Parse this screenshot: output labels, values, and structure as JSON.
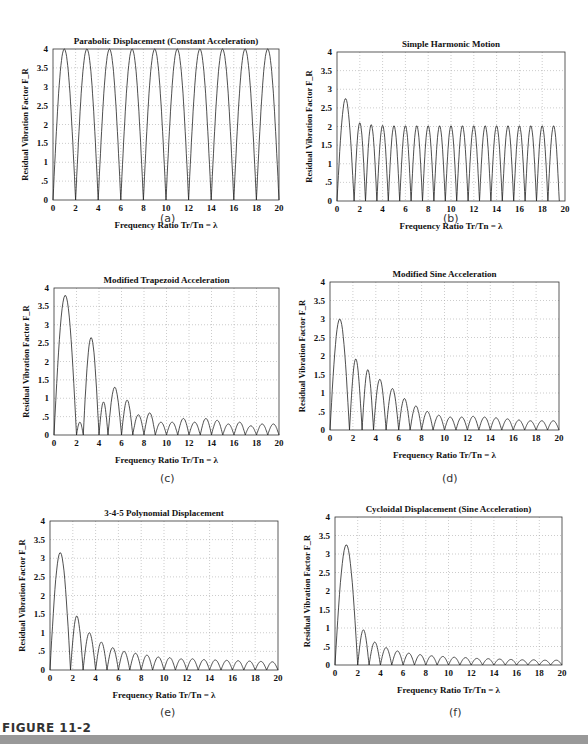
{
  "figure": {
    "label": "FIGURE 11-2"
  },
  "common": {
    "xlabel": "Frequency Ratio  Tr/Tn  = λ",
    "ylabel": "Residual Vibration Factor  F_R",
    "xticks": [
      0,
      2,
      4,
      6,
      8,
      10,
      12,
      14,
      16,
      18,
      20
    ],
    "yticks": [
      "0",
      ".5",
      "1",
      "1.5",
      "2",
      "2.5",
      "3",
      "3.5",
      "4"
    ]
  },
  "chart_data": [
    {
      "id": "a",
      "type": "line",
      "title": "Parabolic Displacement (Constant Acceleration)",
      "subcaption": "(a)",
      "xlabel": "Frequency Ratio Tr/Tn = λ",
      "ylabel": "Residual Vibration Factor F_R",
      "xlim": [
        0,
        20
      ],
      "ylim": [
        0,
        4
      ],
      "grid": true,
      "model": "abs_sin_peaks",
      "peaks": [
        {
          "x": 1,
          "y": 4
        },
        {
          "x": 3,
          "y": 4
        },
        {
          "x": 5,
          "y": 4
        },
        {
          "x": 7,
          "y": 4
        },
        {
          "x": 9,
          "y": 4
        },
        {
          "x": 11,
          "y": 4
        },
        {
          "x": 13,
          "y": 4
        },
        {
          "x": 15,
          "y": 4
        },
        {
          "x": 17,
          "y": 4
        },
        {
          "x": 19,
          "y": 4
        }
      ],
      "zeros": [
        0,
        2,
        4,
        6,
        8,
        10,
        12,
        14,
        16,
        18,
        20
      ]
    },
    {
      "id": "b",
      "type": "line",
      "title": "Simple Harmonic Motion",
      "subcaption": "(b)",
      "xlabel": "Frequency Ratio Tr/Tn = λ",
      "ylabel": "Residual Vibration Factor F_R",
      "xlim": [
        0,
        20
      ],
      "ylim": [
        0,
        4
      ],
      "grid": true,
      "zeros": [
        0,
        1.5,
        2.5,
        3.5,
        4.5,
        5.5,
        6.5,
        7.5,
        8.5,
        9.5,
        10.5,
        11.5,
        12.5,
        13.5,
        14.5,
        15.5,
        16.5,
        17.5,
        18.5,
        19.5
      ],
      "peak_values": [
        2.75,
        2.1,
        2.05,
        2.03,
        2.02,
        2.02,
        2.02,
        2.02,
        2.02,
        2.02,
        2.02,
        2.02,
        2.02,
        2.02,
        2.02,
        2.02,
        2.02,
        2.02,
        2.02,
        2.02
      ]
    },
    {
      "id": "c",
      "type": "line",
      "title": "Modified Trapezoid Acceleration",
      "subcaption": "(c)",
      "xlabel": "Frequency Ratio Tr/Tn = λ",
      "ylabel": "Residual Vibration Factor F_R",
      "xlim": [
        0,
        20
      ],
      "ylim": [
        0,
        4
      ],
      "grid": true,
      "zeros": [
        0,
        2,
        2.6,
        4,
        4.8,
        6,
        7,
        8,
        9,
        10,
        11,
        12,
        13,
        14,
        15,
        16,
        17,
        18,
        19,
        20
      ],
      "peak_values": [
        3.8,
        0.35,
        2.65,
        0.9,
        1.3,
        0.95,
        0.55,
        0.6,
        0.35,
        0.35,
        0.45,
        0.35,
        0.45,
        0.4,
        0.3,
        0.35,
        0.25,
        0.3,
        0.3
      ]
    },
    {
      "id": "d",
      "type": "line",
      "title": "Modified Sine Acceleration",
      "subcaption": "(d)",
      "xlabel": "Frequency Ratio Tr/Tn = λ",
      "ylabel": "Residual Vibration Factor F_R",
      "xlim": [
        0,
        20
      ],
      "ylim": [
        0,
        4
      ],
      "grid": true,
      "zeros": [
        0,
        1.7,
        2.8,
        3.8,
        4.9,
        6,
        7,
        8,
        9,
        10,
        11,
        12,
        13,
        14,
        15,
        16,
        17,
        18,
        19,
        20
      ],
      "peak_values": [
        3.0,
        1.92,
        1.63,
        1.37,
        1.12,
        0.85,
        0.65,
        0.5,
        0.4,
        0.35,
        0.35,
        0.37,
        0.35,
        0.33,
        0.3,
        0.27,
        0.25,
        0.25,
        0.25
      ]
    },
    {
      "id": "e",
      "type": "line",
      "title": "3-4-5 Polynomial Displacement",
      "subcaption": "(e)",
      "xlabel": "Frequency Ratio Tr/Tn = λ",
      "ylabel": "Residual Vibration Factor F_R",
      "xlim": [
        0,
        20
      ],
      "ylim": [
        0,
        4
      ],
      "grid": true,
      "zeros": [
        0,
        1.8,
        2.9,
        4,
        5,
        6,
        7,
        8,
        9,
        10,
        11,
        12,
        13,
        14,
        15,
        16,
        17,
        18,
        19,
        20
      ],
      "peak_values": [
        3.15,
        1.45,
        1.0,
        0.75,
        0.6,
        0.5,
        0.45,
        0.4,
        0.35,
        0.33,
        0.3,
        0.3,
        0.28,
        0.27,
        0.26,
        0.25,
        0.24,
        0.23,
        0.22
      ]
    },
    {
      "id": "f",
      "type": "line",
      "title": "Cycloidal Displacement (Sine Acceleration)",
      "subcaption": "(f)",
      "xlabel": "Frequency Ratio Tr/Tn = λ",
      "ylabel": "Residual Vibration Factor F_R",
      "xlim": [
        0,
        20
      ],
      "ylim": [
        0,
        4
      ],
      "grid": true,
      "zeros": [
        0,
        2,
        3,
        4,
        5,
        6,
        7,
        8,
        9,
        10,
        11,
        12,
        13,
        14,
        15,
        16,
        17,
        18,
        19,
        20
      ],
      "peak_values": [
        3.25,
        0.95,
        0.62,
        0.47,
        0.38,
        0.32,
        0.28,
        0.25,
        0.23,
        0.21,
        0.2,
        0.18,
        0.17,
        0.16,
        0.15,
        0.14,
        0.14,
        0.13,
        0.13
      ]
    }
  ]
}
